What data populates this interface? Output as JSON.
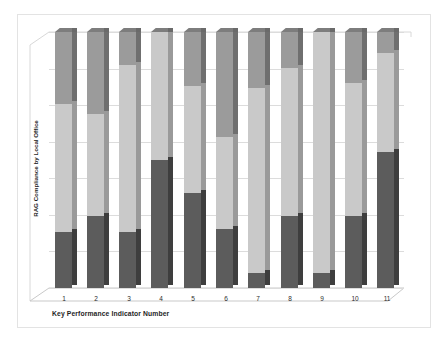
{
  "chart_data": {
    "type": "bar",
    "subtype": "stacked-100-percent-3d",
    "title": "",
    "xlabel": "Key Performance Indicator Number",
    "ylabel": "RAG Compliance by Local Office",
    "categories": [
      "1",
      "2",
      "3",
      "4",
      "5",
      "6",
      "7",
      "8",
      "9",
      "10",
      "11"
    ],
    "ylim": [
      0,
      100
    ],
    "grid": true,
    "y_tick_labels_visible": false,
    "legend_visible": false,
    "gridline_count": 7,
    "series": [
      {
        "name": "Red",
        "color": "#5c5c5c",
        "stack_position": "bottom",
        "values": [
          22,
          28,
          22,
          50,
          37,
          23,
          6,
          28,
          6,
          28,
          53
        ]
      },
      {
        "name": "Amber",
        "color": "#c9c9c9",
        "stack_position": "middle",
        "values": [
          50,
          40,
          65,
          50,
          42,
          36,
          72,
          58,
          94,
          52,
          39
        ]
      },
      {
        "name": "Green",
        "color": "#9b9b9b",
        "stack_position": "top",
        "values": [
          28,
          32,
          13,
          0,
          21,
          41,
          22,
          14,
          0,
          20,
          8
        ]
      }
    ]
  },
  "colors": {
    "bottom_segment": "#5c5c5c",
    "middle_segment": "#c9c9c9",
    "top_segment": "#9b9b9b",
    "gridline": "#dcdcdc",
    "frame_border": "#e3e3e3",
    "background": "#ffffff"
  }
}
